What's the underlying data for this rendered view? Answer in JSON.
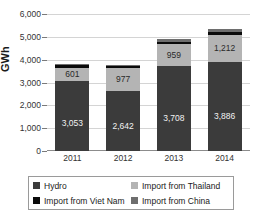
{
  "chart_data": {
    "type": "bar",
    "title": "",
    "xlabel": "",
    "ylabel": "GWh",
    "ylim": [
      0,
      6000
    ],
    "ytick_step": 1000,
    "grid": true,
    "stacked": true,
    "legend_position": "bottom",
    "categories": [
      "2011",
      "2012",
      "2013",
      "2014"
    ],
    "ytick_labels": [
      "6,000",
      "5,000",
      "4,000",
      "3,000",
      "2,000",
      "1,000",
      "0"
    ],
    "series": [
      {
        "name": "Hydro",
        "color": "#3b3b3b",
        "values": [
          3053,
          2642,
          3708,
          3886
        ],
        "labels": [
          "3,053",
          "2,642",
          "3,708",
          "3,886"
        ]
      },
      {
        "name": "Import from Thailand",
        "color": "#b4b4b4",
        "values": [
          601,
          977,
          959,
          1212
        ],
        "labels": [
          "601",
          "977",
          "959",
          "1,212"
        ]
      },
      {
        "name": "Import from Viet Nam",
        "color": "#0b0b0b",
        "values": [
          100,
          95,
          110,
          125
        ],
        "labels": [
          "",
          "",
          "",
          ""
        ]
      },
      {
        "name": "Import from China",
        "color": "#6e6e6e",
        "values": [
          45,
          40,
          115,
          130
        ],
        "labels": [
          "",
          "",
          "",
          ""
        ]
      }
    ]
  },
  "axis": {
    "y_title": "GWh"
  },
  "legend": {
    "items": [
      {
        "label": "Hydro"
      },
      {
        "label": "Import from Thailand"
      },
      {
        "label": "Import from Viet Nam"
      },
      {
        "label": "Import from China"
      }
    ]
  }
}
